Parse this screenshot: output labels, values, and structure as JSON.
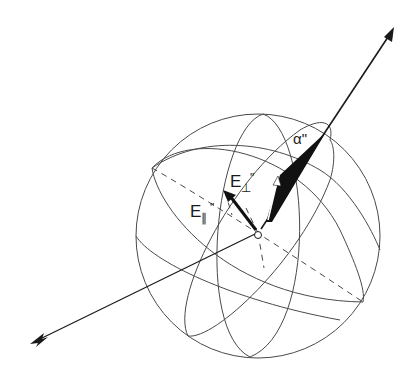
{
  "figure": {
    "type": "3D polarization sphere diagram",
    "background": "#ffffff",
    "ink": "#1a1a1a",
    "sphere": {
      "cx": 258,
      "cy": 236,
      "r": 122
    },
    "origin": {
      "x": 258,
      "y": 233
    },
    "outgoing_ray": {
      "from": [
        258,
        233
      ],
      "to": [
        393,
        28
      ],
      "head": "arrowhead"
    },
    "incoming_ray": {
      "from": [
        33,
        342
      ],
      "to": [
        258,
        233
      ],
      "tail": "fletching"
    },
    "labels": {
      "alpha": "α\"",
      "e_perp_base": "E",
      "e_perp_sub": "⊥",
      "e_perp_mark": "\"",
      "e_par_base": "E",
      "e_par_sub": "∥",
      "e_par_mark": "\""
    }
  }
}
